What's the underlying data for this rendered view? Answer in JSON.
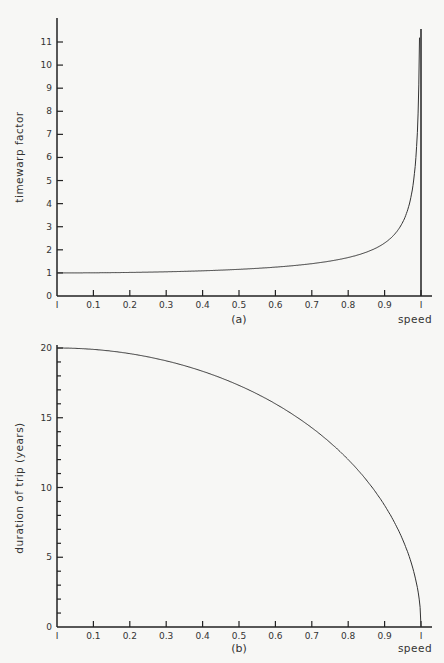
{
  "chart_data": [
    {
      "id": "a",
      "type": "line",
      "title": "",
      "caption": "(a)",
      "xlabel": "speed",
      "ylabel": "timewarp factor",
      "xlim": [
        0,
        1
      ],
      "ylim": [
        0,
        11
      ],
      "x_ticks": [
        0,
        0.1,
        0.2,
        0.3,
        0.4,
        0.5,
        0.6,
        0.7,
        0.8,
        0.9,
        1
      ],
      "x_tick_labels": [
        "I",
        "0.1",
        "0.2",
        "0.3",
        "0.4",
        "0.5",
        "0.6",
        "0.7",
        "0.8",
        "0.9",
        "I"
      ],
      "y_ticks": [
        0,
        1,
        2,
        3,
        4,
        5,
        6,
        7,
        8,
        9,
        10,
        11
      ],
      "y_tick_labels": [
        "0",
        "1",
        "2",
        "3",
        "4",
        "5",
        "6",
        "7",
        "8",
        "9",
        "10",
        "11"
      ],
      "grid": false,
      "legend": "none",
      "annotations": [
        "vertical asymptote at speed = 1"
      ],
      "series": [
        {
          "name": "timewarp factor",
          "x": [
            0,
            0.1,
            0.2,
            0.3,
            0.4,
            0.5,
            0.6,
            0.7,
            0.8,
            0.9,
            0.95,
            0.99
          ],
          "y": [
            1.0,
            1.01,
            1.02,
            1.05,
            1.09,
            1.15,
            1.25,
            1.4,
            1.67,
            2.29,
            3.2,
            7.09
          ]
        }
      ]
    },
    {
      "id": "b",
      "type": "line",
      "title": "",
      "caption": "(b)",
      "xlabel": "speed",
      "ylabel": "duration of trip (years)",
      "xlim": [
        0,
        1
      ],
      "ylim": [
        0,
        20
      ],
      "x_ticks": [
        0,
        0.1,
        0.2,
        0.3,
        0.4,
        0.5,
        0.6,
        0.7,
        0.8,
        0.9,
        1
      ],
      "x_tick_labels": [
        "I",
        "0.1",
        "0.2",
        "0.3",
        "0.4",
        "0.5",
        "0.6",
        "0.7",
        "0.8",
        "0.9",
        "I"
      ],
      "y_ticks": [
        0,
        5,
        10,
        15,
        20
      ],
      "y_tick_labels": [
        "0",
        "5",
        "10",
        "15",
        "20"
      ],
      "y_minor_step": 1,
      "grid": false,
      "legend": "none",
      "series": [
        {
          "name": "duration of trip",
          "x": [
            0,
            0.1,
            0.2,
            0.3,
            0.4,
            0.5,
            0.6,
            0.7,
            0.8,
            0.9,
            0.95,
            1
          ],
          "y": [
            20.0,
            19.9,
            19.6,
            19.08,
            18.33,
            17.32,
            16.0,
            14.28,
            12.0,
            8.72,
            6.24,
            0
          ]
        }
      ]
    }
  ],
  "colors": {
    "background": "#f7f7f5",
    "ink": "#222222",
    "curve": "#333333"
  }
}
